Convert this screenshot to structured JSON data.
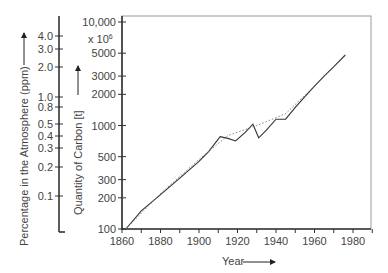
{
  "chart_data": {
    "type": "line",
    "title": "",
    "xlabel": "Year",
    "ylabel": "Quantity of Carbon [t]",
    "ylabel_secondary": "Percentage in the Atmosphere (ppm)",
    "y_multiplier_label": "x 10^6",
    "x_ticks": [
      1860,
      1880,
      1900,
      1920,
      1940,
      1960,
      1980
    ],
    "xlim": [
      1860,
      1990
    ],
    "y_scale": "log",
    "ylim": [
      100,
      10000
    ],
    "y_ticks": [
      "100",
      "200",
      "300",
      "500",
      "1000",
      "2000",
      "3000",
      "5000",
      "10,000"
    ],
    "y_tick_values": [
      100,
      200,
      300,
      500,
      1000,
      2000,
      3000,
      5000,
      10000
    ],
    "y2_ticks": [
      "0.1",
      "0.2",
      "0.3",
      "0.4",
      "0.5",
      "0.8",
      "1.0",
      "2.0",
      "3.0",
      "4.0"
    ],
    "y2_tick_values": [
      0.1,
      0.2,
      0.3,
      0.4,
      0.5,
      0.8,
      1.0,
      2.0,
      3.0,
      4.0
    ],
    "grid": false,
    "series": [
      {
        "name": "Quantity of carbon (observed)",
        "style": "solid",
        "x": [
          1862,
          1870,
          1880,
          1890,
          1900,
          1905,
          1911,
          1915,
          1919,
          1924,
          1928,
          1931,
          1935,
          1940,
          1945,
          1950,
          1955,
          1960,
          1965,
          1970,
          1976
        ],
        "values": [
          100,
          150,
          215,
          310,
          450,
          560,
          780,
          750,
          710,
          860,
          1030,
          760,
          900,
          1150,
          1150,
          1500,
          1900,
          2400,
          3000,
          3700,
          4800
        ]
      },
      {
        "name": "Quantity of carbon (trend)",
        "style": "dotted",
        "x": [
          1862,
          1880,
          1900,
          1915,
          1930,
          1945,
          1960,
          1976
        ],
        "values": [
          100,
          220,
          470,
          800,
          1000,
          1300,
          2400,
          4800
        ]
      }
    ]
  },
  "labels": {
    "left_axis_title": "Percentage in the Atmosphere (ppm)",
    "carbon_axis_title": "Quantity of Carbon [t]",
    "multiplier": "x 10",
    "multiplier_exp": "6",
    "x_axis_title": "Year"
  }
}
